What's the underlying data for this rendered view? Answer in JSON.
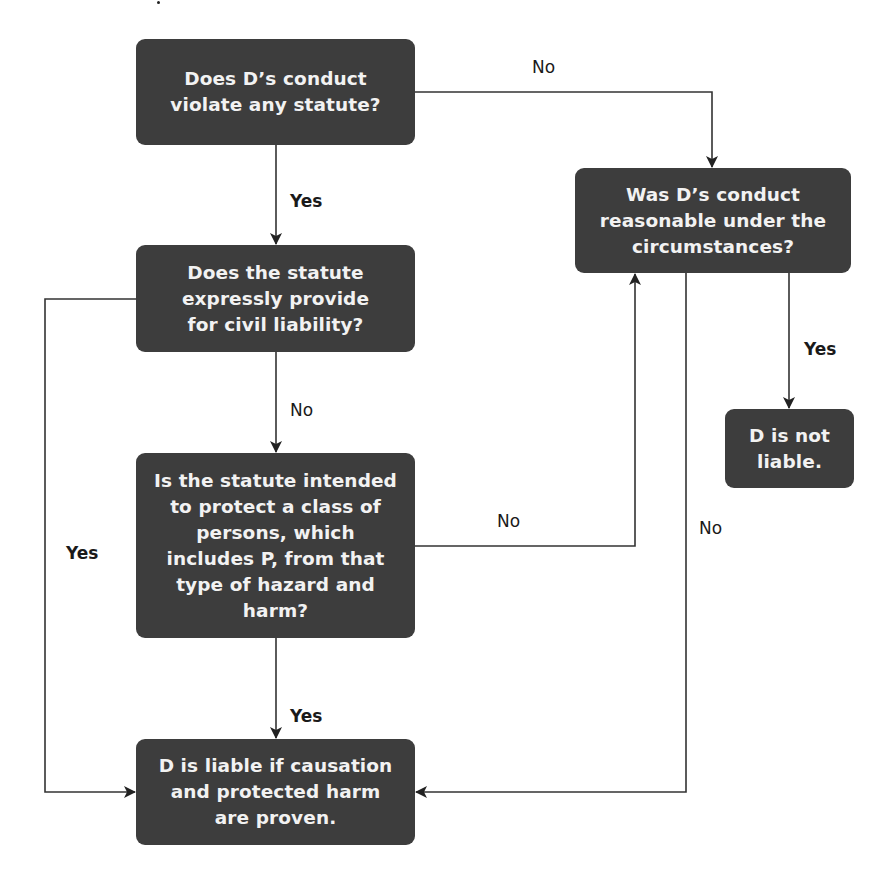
{
  "diagram": {
    "type": "flowchart",
    "colors": {
      "node_fill": "#3d3d3d",
      "node_text": "#f2f2f2",
      "connector": "#333333",
      "label_text": "#1a1a1a",
      "background": "#ffffff"
    },
    "nodes": {
      "q_statute_violation": {
        "text": "Does D’s conduct\nviolate any statute?"
      },
      "q_express_liability": {
        "text": "Does the statute\nexpressly provide\nfor civil liability?"
      },
      "q_protected_class": {
        "text": "Is the statute intended\nto protect a class of\npersons, which\nincludes P, from that\ntype of hazard and\nharm?"
      },
      "r_liable": {
        "text": "D is liable if causation\nand protected harm\nare proven."
      },
      "q_reasonable": {
        "text": "Was D’s conduct\nreasonable under the\ncircumstances?"
      },
      "r_not_liable": {
        "text": "D is not\nliable."
      }
    },
    "edges": [
      {
        "from": "q_statute_violation",
        "to": "q_reasonable",
        "label": "No"
      },
      {
        "from": "q_statute_violation",
        "to": "q_express_liability",
        "label": "Yes"
      },
      {
        "from": "q_express_liability",
        "to": "r_liable",
        "label": "Yes"
      },
      {
        "from": "q_express_liability",
        "to": "q_protected_class",
        "label": "No"
      },
      {
        "from": "q_protected_class",
        "to": "q_reasonable",
        "label": "No"
      },
      {
        "from": "q_protected_class",
        "to": "r_liable",
        "label": "Yes"
      },
      {
        "from": "q_reasonable",
        "to": "r_not_liable",
        "label": "Yes"
      },
      {
        "from": "q_reasonable",
        "to": "r_liable",
        "label": "No"
      }
    ],
    "labels": {
      "e1": "No",
      "e2": "Yes",
      "e3": "Yes",
      "e4": "No",
      "e5": "No",
      "e6": "Yes",
      "e7": "Yes",
      "e8": "No"
    }
  }
}
